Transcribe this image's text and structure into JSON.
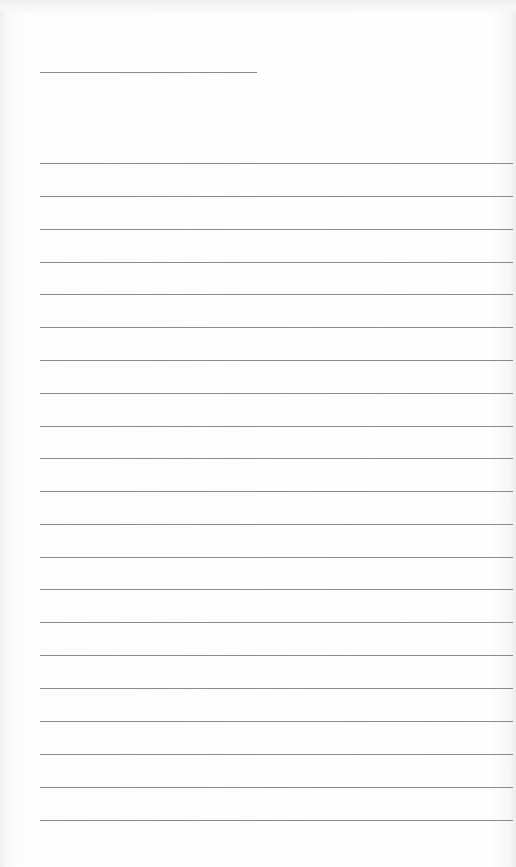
{
  "page": {
    "type": "blank lined note sheet",
    "background_color": "#fdfdfd",
    "line_color": "#8a8a8a",
    "title_line": {
      "x": 40,
      "y": 72,
      "width": 217
    },
    "ruled_lines": {
      "count": 21,
      "x_start": 40,
      "x_end": 513,
      "y_positions": [
        163,
        196,
        229,
        262,
        294,
        327,
        360,
        393,
        426,
        458,
        491,
        524,
        557,
        589,
        622,
        655,
        688,
        721,
        754,
        787,
        820
      ]
    },
    "text": ""
  }
}
